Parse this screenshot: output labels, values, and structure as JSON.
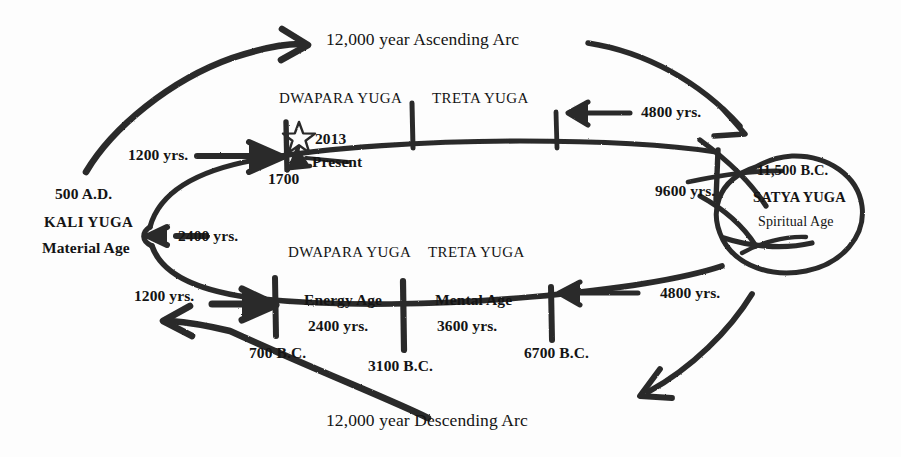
{
  "diagram": {
    "ink_color": "#2b2b2b",
    "paper_color": "#fdfdfd"
  },
  "arcs": {
    "ascending": "12,000 year Ascending Arc",
    "descending": "12,000 year Descending Arc"
  },
  "upper_line": {
    "yuga_labels": [
      {
        "name": "DWAPARA YUGA"
      },
      {
        "name": "TRETA YUGA"
      }
    ],
    "markers": [
      {
        "date": "1700"
      }
    ],
    "present": {
      "year": "2013",
      "label": "Present",
      "icon": "star-icon"
    },
    "durations": [
      {
        "value": "1200 yrs."
      },
      {
        "value": "4800 yrs."
      },
      {
        "value": "9600 yrs."
      }
    ]
  },
  "lower_line": {
    "yuga_labels": [
      {
        "name": "DWAPARA YUGA"
      },
      {
        "name": "TRETA YUGA"
      }
    ],
    "segments": [
      {
        "age": "Energy Age",
        "duration": "2400 yrs."
      },
      {
        "age": "Mental Age",
        "duration": "3600 yrs."
      }
    ],
    "markers": [
      {
        "date": "700 B.C."
      },
      {
        "date": "3100 B.C."
      },
      {
        "date": "6700 B.C."
      }
    ],
    "durations": [
      {
        "value": "1200 yrs."
      },
      {
        "value": "4800 yrs."
      }
    ]
  },
  "kali_yuga": {
    "date": "500 A.D.",
    "name": "KALI YUGA",
    "subtitle": "Material Age",
    "duration": "2400 yrs."
  },
  "satya_yuga": {
    "date": "11,500 B.C.",
    "name": "SATYA YUGA",
    "subtitle": "Spiritual Age"
  }
}
